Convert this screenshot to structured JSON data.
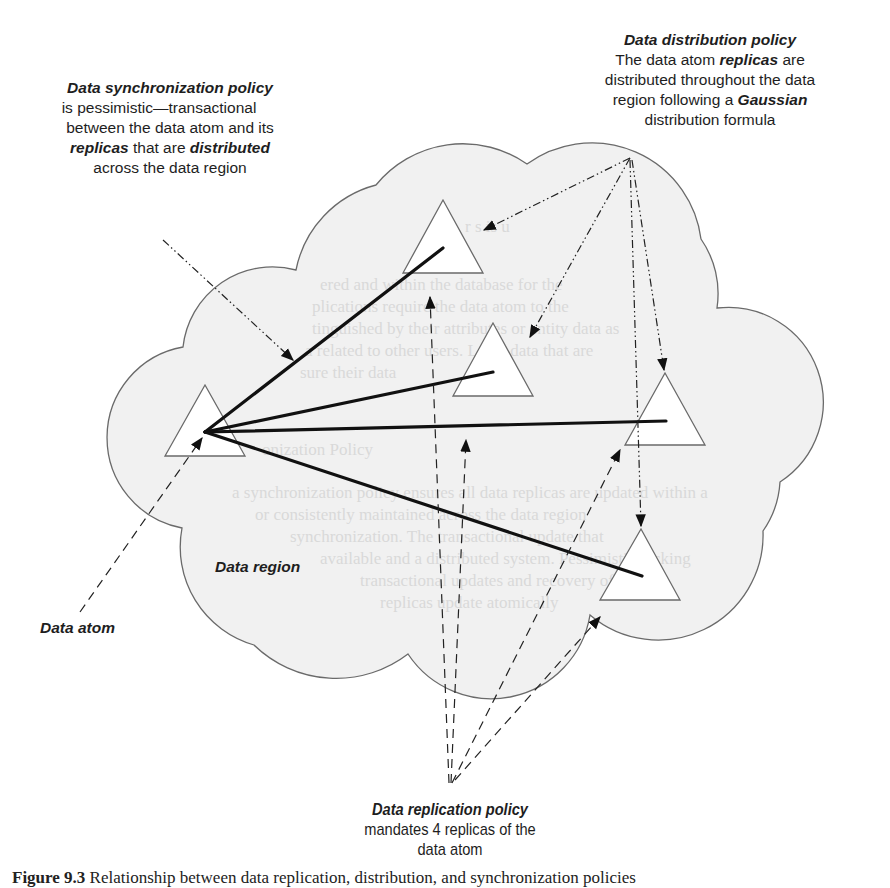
{
  "figure": {
    "caption_label": "Figure 9.3",
    "caption_text": "Relationship between data replication, distribution, and synchronization policies"
  },
  "annotations": {
    "synchronization_policy": {
      "title": "Data synchronization  policy",
      "line1": "is pessimistic—transactional",
      "line2": "between the data atom and its",
      "line3_bold1": "replicas",
      "line3_mid": " that are ",
      "line3_bold2": "distributed",
      "line4": "across the data region"
    },
    "distribution_policy": {
      "title": "Data distribution  policy",
      "line1_pre": "The data atom ",
      "line1_bold": "replicas",
      "line1_post": " are",
      "line2": "distributed throughout the data",
      "line3_pre": "region following a ",
      "line3_bold": "Gaussian",
      "line4": "distribution formula"
    },
    "replication_policy": {
      "title": "Data replication policy",
      "line1": "mandates 4 replicas of the",
      "line2": "data atom"
    },
    "data_region_label": "Data region",
    "data_atom_label": "Data atom"
  },
  "nodes": {
    "data_atom": {
      "name": "Data atom",
      "apex": [
        205,
        385
      ],
      "base_left": [
        165,
        456
      ],
      "base_right": [
        245,
        456
      ],
      "hub": [
        205,
        432
      ]
    },
    "replicas": [
      {
        "id": 1,
        "apex": [
          443,
          200
        ],
        "base_left": [
          403,
          273
        ],
        "base_right": [
          483,
          273
        ],
        "line_end": [
          443,
          248
        ]
      },
      {
        "id": 2,
        "apex": [
          493,
          323
        ],
        "base_left": [
          453,
          396
        ],
        "base_right": [
          533,
          396
        ],
        "line_end": [
          493,
          372
        ]
      },
      {
        "id": 3,
        "apex": [
          665,
          373
        ],
        "base_left": [
          625,
          445
        ],
        "base_right": [
          705,
          445
        ],
        "line_end": [
          666,
          421
        ]
      },
      {
        "id": 4,
        "apex": [
          641,
          529
        ],
        "base_left": [
          600,
          600
        ],
        "base_right": [
          680,
          600
        ],
        "line_end": [
          642,
          576
        ]
      }
    ],
    "replica_count": 4
  },
  "colors": {
    "cloud_fill": "#f1f1f1",
    "cloud_stroke": "#6a6a6a",
    "line": "#111111",
    "text": "#1e1e1e"
  }
}
